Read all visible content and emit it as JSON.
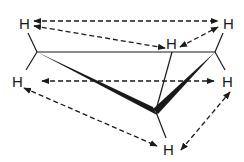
{
  "diagram": {
    "type": "molecular-structure",
    "colors": {
      "line": "#1a1a1a",
      "background": "#ffffff"
    },
    "atoms": [
      {
        "id": "h_top_left",
        "label": "H",
        "x": 20,
        "y": 30
      },
      {
        "id": "h_top_right",
        "label": "H",
        "x": 222,
        "y": 30
      },
      {
        "id": "h_mid_upper",
        "label": "H",
        "x": 168,
        "y": 49
      },
      {
        "id": "h_left",
        "label": "H",
        "x": 12,
        "y": 87
      },
      {
        "id": "h_right",
        "label": "H",
        "x": 222,
        "y": 87
      },
      {
        "id": "h_bottom",
        "label": "H",
        "x": 163,
        "y": 154
      }
    ],
    "carbons": [
      {
        "id": "c_left",
        "x": 37,
        "y": 52
      },
      {
        "id": "c_right",
        "x": 215,
        "y": 52
      },
      {
        "id": "c_bottom",
        "x": 155,
        "y": 111
      }
    ],
    "interactions": [
      {
        "from": "h_top_left",
        "to": "h_top_right"
      },
      {
        "from": "h_top_left",
        "to": "h_mid_upper"
      },
      {
        "from": "h_mid_upper",
        "to": "h_top_right"
      },
      {
        "from": "h_left",
        "to": "h_right"
      },
      {
        "from": "h_left",
        "to": "h_bottom"
      },
      {
        "from": "h_bottom",
        "to": "h_right"
      }
    ]
  }
}
